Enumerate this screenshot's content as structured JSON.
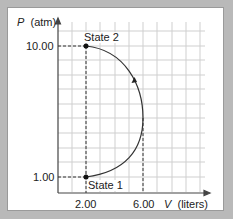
{
  "diagram": {
    "y_axis": {
      "symbol": "P",
      "unit": "(atm)"
    },
    "x_axis": {
      "symbol": "V",
      "unit": "(liters)"
    },
    "y_ticks": [
      "10.00",
      "1.00"
    ],
    "x_ticks": [
      "2.00",
      "6.00"
    ],
    "states": [
      {
        "label": "State 2",
        "V": 2.0,
        "P": 10.0
      },
      {
        "label": "State 1",
        "V": 2.0,
        "P": 1.0
      }
    ],
    "path_direction": "State 1 to State 2 via arc through V = 6.00",
    "colors": {
      "background": "#b9b9b9",
      "panel": "#ffffff",
      "grid": "#cfcfcf",
      "curve": "#333333"
    }
  }
}
